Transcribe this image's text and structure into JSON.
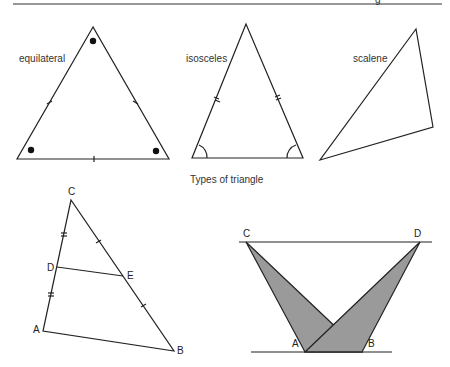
{
  "header": {
    "partial_text": "g"
  },
  "figure1": {
    "caption": "Types of triangle",
    "triangles": [
      {
        "name": "equilateral",
        "label": "equilateral"
      },
      {
        "name": "isosceles",
        "label": "isosceles"
      },
      {
        "name": "scalene",
        "label": "scalene"
      }
    ]
  },
  "figure2": {
    "vertices": {
      "C": "C",
      "D": "D",
      "E": "E",
      "A": "A",
      "B": "B"
    }
  },
  "figure3": {
    "vertices": {
      "C": "C",
      "D": "D",
      "A": "A",
      "B": "B"
    },
    "fill_color": "#9a9a9a"
  }
}
